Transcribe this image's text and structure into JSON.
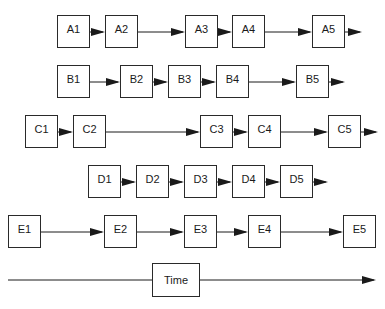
{
  "diagram": {
    "type": "parallel-timeline-process-flow",
    "rows": [
      {
        "id": "A",
        "boxes": [
          {
            "label": "A1",
            "x": 57,
            "y": 15
          },
          {
            "label": "A2",
            "x": 105,
            "y": 15
          },
          {
            "label": "A3",
            "x": 185,
            "y": 15
          },
          {
            "label": "A4",
            "x": 232,
            "y": 15
          },
          {
            "label": "A5",
            "x": 312,
            "y": 15
          }
        ],
        "tail_end": 362
      },
      {
        "id": "B",
        "boxes": [
          {
            "label": "B1",
            "x": 57,
            "y": 65
          },
          {
            "label": "B2",
            "x": 120,
            "y": 65
          },
          {
            "label": "B3",
            "x": 168,
            "y": 65
          },
          {
            "label": "B4",
            "x": 216,
            "y": 65
          },
          {
            "label": "B5",
            "x": 296,
            "y": 65
          }
        ],
        "tail_end": 345
      },
      {
        "id": "C",
        "boxes": [
          {
            "label": "C1",
            "x": 25,
            "y": 115
          },
          {
            "label": "C2",
            "x": 73,
            "y": 115
          },
          {
            "label": "C3",
            "x": 200,
            "y": 115
          },
          {
            "label": "C4",
            "x": 248,
            "y": 115
          },
          {
            "label": "C5",
            "x": 328,
            "y": 115
          }
        ],
        "tail_end": 378
      },
      {
        "id": "D",
        "boxes": [
          {
            "label": "D1",
            "x": 88,
            "y": 165
          },
          {
            "label": "D2",
            "x": 136,
            "y": 165
          },
          {
            "label": "D3",
            "x": 184,
            "y": 165
          },
          {
            "label": "D4",
            "x": 232,
            "y": 165
          },
          {
            "label": "D5",
            "x": 280,
            "y": 165
          }
        ],
        "tail_end": 328
      },
      {
        "id": "E",
        "boxes": [
          {
            "label": "E1",
            "x": 8,
            "y": 215
          },
          {
            "label": "E2",
            "x": 104,
            "y": 215
          },
          {
            "label": "E3",
            "x": 184,
            "y": 215
          },
          {
            "label": "E4",
            "x": 248,
            "y": 215
          },
          {
            "label": "E5",
            "x": 343,
            "y": 215
          }
        ],
        "tail_end": null
      }
    ],
    "box_size": {
      "w": 33,
      "h": 33
    },
    "time_axis": {
      "label": "Time",
      "x1": 8,
      "x2": 376,
      "y": 280,
      "box": {
        "x": 152,
        "y": 263,
        "w": 48,
        "h": 34
      }
    },
    "colors": {
      "line": "#1a1a1a",
      "box_border": "#2a2a2a",
      "background": "#ffffff"
    }
  }
}
